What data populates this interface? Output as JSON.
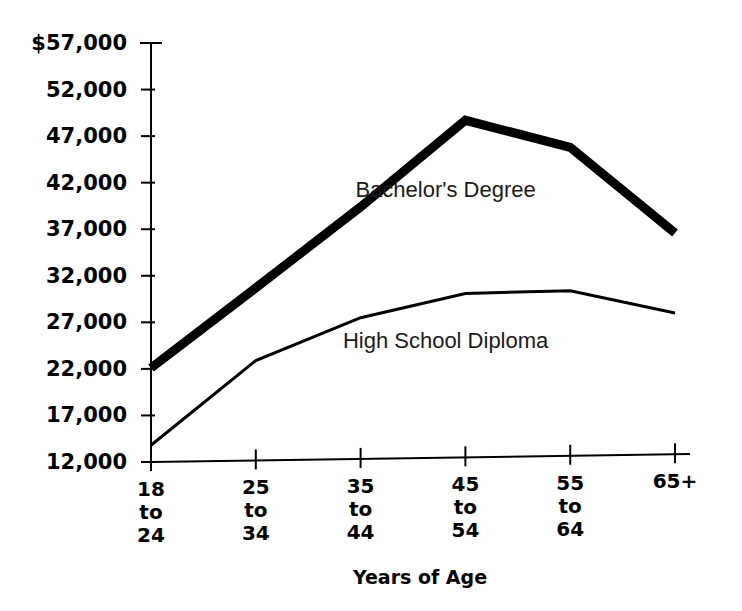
{
  "chart_data": {
    "type": "line",
    "title": "",
    "xlabel": "Years of Age",
    "ylabel": "",
    "categories": [
      "18 to 24",
      "25 to 34",
      "35 to 44",
      "45 to 54",
      "55 to 64",
      "65+"
    ],
    "category_lines": [
      [
        "18",
        "to",
        "24"
      ],
      [
        "25",
        "to",
        "34"
      ],
      [
        "35",
        "to",
        "44"
      ],
      [
        "45",
        "to",
        "54"
      ],
      [
        "55",
        "to",
        "64"
      ],
      [
        "65+"
      ]
    ],
    "ylim": [
      12000,
      57000
    ],
    "ytick_values": [
      57000,
      52000,
      47000,
      42000,
      37000,
      32000,
      27000,
      22000,
      17000,
      12000
    ],
    "ytick_labels": [
      "$57,000",
      "52,000",
      "47,000",
      "42,000",
      "37,000",
      "32,000",
      "27,000",
      "22,000",
      "17,000",
      "12,000"
    ],
    "grid": false,
    "legend_position": "inline-annotation",
    "series": [
      {
        "name": "Bachelor's Degree",
        "values": [
          22100,
          30700,
          39400,
          48700,
          45800,
          36600
        ],
        "line_width": 9,
        "color": "#000000",
        "label_x_category": "35 to 44",
        "label_value": 40500
      },
      {
        "name": "High School Diploma",
        "values": [
          13800,
          22900,
          27500,
          30100,
          30400,
          28000
        ],
        "line_width": 3,
        "color": "#000000",
        "label_x_category": "35 to 44",
        "label_value": 24200
      }
    ]
  },
  "axes": {
    "y_axis_name": "income-axis",
    "x_axis_name": "age-axis"
  }
}
